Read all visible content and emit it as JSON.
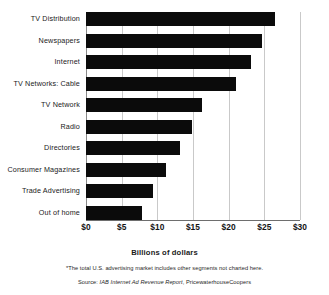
{
  "chart_data": {
    "type": "bar",
    "orientation": "horizontal",
    "title": "",
    "xlabel": "Billions of dollars",
    "ylabel": "",
    "xlim": [
      0,
      30
    ],
    "xtick_values": [
      0,
      5,
      10,
      15,
      20,
      25,
      30
    ],
    "xtick_labels": [
      "$0",
      "$5",
      "$10",
      "$15",
      "$20",
      "$25",
      "$30"
    ],
    "grid": true,
    "grid_axis": "x",
    "legend": false,
    "bar_color": "#0b0b0b",
    "categories": [
      "TV Distribution",
      "Newspapers",
      "Internet",
      "TV Networks: Cable",
      "TV Network",
      "Radio",
      "Directories",
      "Consumer Magazines",
      "Trade Advertising",
      "Out of home"
    ],
    "values": [
      26.5,
      24.7,
      23.1,
      21.0,
      16.3,
      14.9,
      13.2,
      11.2,
      9.4,
      7.9
    ],
    "footnote": "*The total U.S. advertising market includes other segments not charted here.",
    "source_prefix": "Source: ",
    "source_italic": "IAB Internet Ad Revenue Report",
    "source_suffix": ", PricewaterhouseCoopers"
  }
}
